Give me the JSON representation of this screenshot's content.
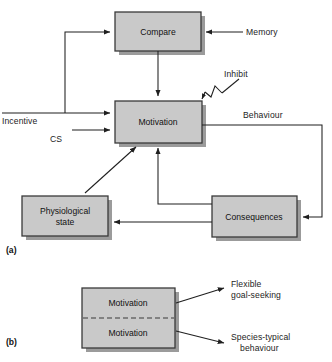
{
  "figure": {
    "type": "flow-diagram",
    "panels": [
      {
        "id": "a",
        "id_label": "(a)",
        "boxes": [
          {
            "key": "compare",
            "label": "Compare",
            "x": 115,
            "y": 12,
            "w": 86,
            "h": 39
          },
          {
            "key": "motivation",
            "label": "Motivation",
            "x": 115,
            "y": 101,
            "w": 87,
            "h": 42
          },
          {
            "key": "physio",
            "label": "Physiological\nstate",
            "line1": "Physiological",
            "line2": "state",
            "x": 22,
            "y": 196,
            "w": 86,
            "h": 40
          },
          {
            "key": "consequences",
            "label": "Consequences",
            "x": 212,
            "y": 196,
            "w": 85,
            "h": 41
          }
        ],
        "edge_labels": [
          {
            "key": "memory",
            "text": "Memory"
          },
          {
            "key": "incentive",
            "text": "Incentive"
          },
          {
            "key": "cs",
            "text": "CS"
          },
          {
            "key": "inhibit",
            "text": "Inhibit"
          },
          {
            "key": "behaviour",
            "text": "Behaviour"
          }
        ],
        "connections": [
          {
            "from": "Memory",
            "to": "Compare",
            "style": "straight-arrow"
          },
          {
            "from": "Compare",
            "to": "Motivation",
            "style": "straight-arrow"
          },
          {
            "from": "Incentive",
            "to": "Motivation",
            "style": "straight-arrow"
          },
          {
            "from": "Incentive",
            "to": "Compare",
            "style": "elbow-arrow"
          },
          {
            "from": "CS",
            "to": "Motivation",
            "style": "straight-arrow"
          },
          {
            "from": "Inhibit",
            "to": "Motivation",
            "style": "diagonal-arrow-with-break"
          },
          {
            "from": "Motivation",
            "to": "Consequences",
            "style": "elbow-arrow",
            "label": "Behaviour"
          },
          {
            "from": "Consequences",
            "to": "Motivation",
            "style": "elbow-arrow"
          },
          {
            "from": "Consequences",
            "to": "Physiological state",
            "style": "straight-arrow"
          },
          {
            "from": "Physiological state",
            "to": "Motivation",
            "style": "diagonal-arrow"
          }
        ]
      },
      {
        "id": "b",
        "id_label": "(b)",
        "box": {
          "x": 82,
          "y": 288,
          "w": 93,
          "h": 60,
          "divider": "dashed",
          "upper_label": "Motivation",
          "lower_label": "Motivation"
        },
        "outputs": [
          {
            "key": "flexible",
            "line1": "Flexible",
            "line2": "goal-seeking"
          },
          {
            "key": "species",
            "line1": "Species-typical",
            "line2": "behaviour"
          }
        ]
      }
    ]
  },
  "colors": {
    "box_fill": "#c9c9c9",
    "box_border": "#3a3a3a",
    "box_shadow": "#9b9b9b",
    "line": "#1f1f1f",
    "text": "#1a1a1a",
    "background": "#ffffff"
  }
}
